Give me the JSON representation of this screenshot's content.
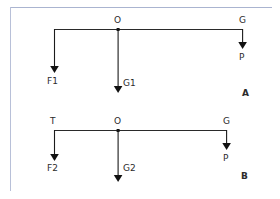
{
  "figure": {
    "background_color": "#ffffff",
    "line_color": "#1b1b1b",
    "frame_color": "#aab4d0",
    "text_color": "#2b2b2b"
  },
  "panels": [
    {
      "id": "A",
      "panel_label": "A",
      "beam": {
        "left_node_label": "",
        "center_node_label": "O",
        "right_node_label": "G"
      },
      "forces": [
        {
          "name": "left-force",
          "label": "F1",
          "direction": "down"
        },
        {
          "name": "center-force",
          "label": "G1",
          "direction": "down"
        },
        {
          "name": "right-force",
          "label": "P",
          "direction": "down"
        }
      ]
    },
    {
      "id": "B",
      "panel_label": "B",
      "beam": {
        "left_node_label": "T",
        "center_node_label": "O",
        "right_node_label": "G"
      },
      "forces": [
        {
          "name": "left-force",
          "label": "F2",
          "direction": "down"
        },
        {
          "name": "center-force",
          "label": "G2",
          "direction": "down"
        },
        {
          "name": "right-force",
          "label": "P",
          "direction": "down"
        }
      ]
    }
  ]
}
